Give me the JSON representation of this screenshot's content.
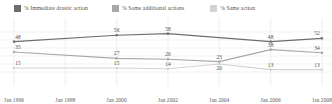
{
  "legend": {
    "items": [
      {
        "label": "% Immediate drastic action",
        "color": "#6d6d6d",
        "name": "legend-immediate-drastic-action"
      },
      {
        "label": "% Some additional actions",
        "color": "#a8a8a8",
        "name": "legend-some-additional-actions"
      },
      {
        "label": "% Same action",
        "color": "#d2d2d2",
        "name": "legend-same-action"
      }
    ]
  },
  "chart_data": {
    "type": "line",
    "title": "",
    "xlabel": "",
    "ylabel": "",
    "grid": true,
    "legend_position": "top",
    "ylim": [
      0,
      70
    ],
    "categories": [
      "Jan 1996",
      "Jan 1998",
      "Jan 2000",
      "Jan 2002",
      "Jan 2004",
      "Jan 2006",
      "Jan 2008"
    ],
    "series": [
      {
        "name": "% Immediate drastic action",
        "color": "#6d6d6d",
        "values": [
          48,
          null,
          56,
          58,
          null,
          48,
          52
        ],
        "labels": [
          "48",
          "",
          "56",
          "58",
          "",
          "48",
          "52"
        ]
      },
      {
        "name": "% Some additional actions",
        "color": "#a8a8a8",
        "values": [
          35,
          null,
          27,
          26,
          23,
          38,
          34
        ],
        "labels": [
          "35",
          "",
          "27",
          "26",
          "23",
          "38",
          "34"
        ]
      },
      {
        "name": "% Same action",
        "color": "#d2d2d2",
        "values": [
          15,
          null,
          15,
          14,
          20,
          13,
          13
        ],
        "labels": [
          "15",
          "",
          "15",
          "14",
          "20",
          "13",
          "13"
        ]
      }
    ]
  }
}
